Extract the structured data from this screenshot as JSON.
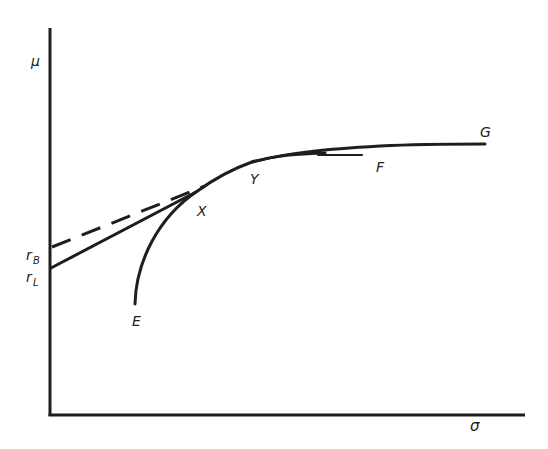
{
  "diagram": {
    "type": "efficient-frontier-with-borrowing-lending",
    "axes": {
      "y_label": "μ",
      "x_label": "σ"
    },
    "intercepts": {
      "borrowing_rate": {
        "label": "r",
        "sub": "B"
      },
      "lending_rate": {
        "label": "r",
        "sub": "L"
      }
    },
    "points": {
      "E": "E",
      "X": "X",
      "Y": "Y",
      "F": "F",
      "G": "G"
    },
    "lines": {
      "lending_line": "solid line from r_L tangent at X",
      "borrowing_line": "dashed line from r_B",
      "frontier": "curve E-X-Y-F",
      "borrowing_frontier": "Y-G"
    },
    "colors": {
      "ink": "#1e1e1e",
      "background": "#ffffff"
    }
  }
}
